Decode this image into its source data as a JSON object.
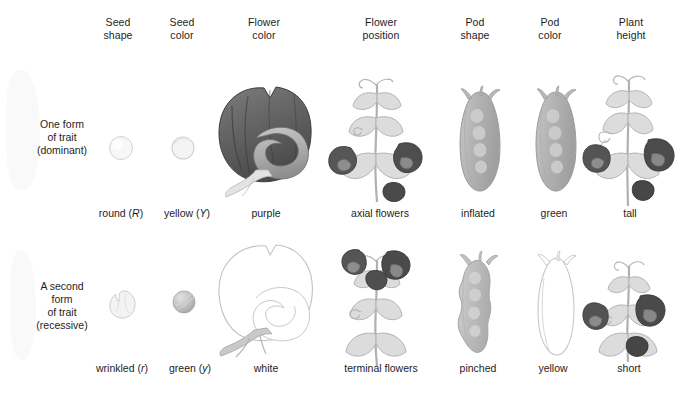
{
  "figure": {
    "background_color": "#ffffff",
    "text_color": "#1d1d1d"
  },
  "columns": [
    {
      "id": "seed-shape",
      "line1": "Seed",
      "line2": "shape"
    },
    {
      "id": "seed-color",
      "line1": "Seed",
      "line2": "color"
    },
    {
      "id": "flower-color",
      "line1": "Flower",
      "line2": "color"
    },
    {
      "id": "flower-position",
      "line1": "Flower",
      "line2": "position"
    },
    {
      "id": "pod-shape",
      "line1": "Pod",
      "line2": "shape"
    },
    {
      "id": "pod-color",
      "line1": "Pod",
      "line2": "color"
    },
    {
      "id": "plant-height",
      "line1": "Plant",
      "line2": "height"
    }
  ],
  "rows": [
    {
      "id": "dominant",
      "label_lines": [
        "One form",
        "of trait",
        "(dominant)"
      ],
      "captions": [
        {
          "id": "seed-shape",
          "text": "round",
          "allele": "R"
        },
        {
          "id": "seed-color",
          "text": "yellow",
          "allele": "Y"
        },
        {
          "id": "flower-color",
          "text": "purple",
          "allele": ""
        },
        {
          "id": "flower-position",
          "text": "axial flowers",
          "allele": ""
        },
        {
          "id": "pod-shape",
          "text": "inflated",
          "allele": ""
        },
        {
          "id": "pod-color",
          "text": "green",
          "allele": ""
        },
        {
          "id": "plant-height",
          "text": "tall",
          "allele": ""
        }
      ]
    },
    {
      "id": "recessive",
      "label_lines": [
        "A second",
        "form",
        "of trait",
        "(recessive)"
      ],
      "captions": [
        {
          "id": "seed-shape",
          "text": "wrinkled",
          "allele": "r"
        },
        {
          "id": "seed-color",
          "text": "green",
          "allele": "y"
        },
        {
          "id": "flower-color",
          "text": "white",
          "allele": ""
        },
        {
          "id": "flower-position",
          "text": "terminal flowers",
          "allele": ""
        },
        {
          "id": "pod-shape",
          "text": "pinched",
          "allele": ""
        },
        {
          "id": "pod-color",
          "text": "yellow",
          "allele": ""
        },
        {
          "id": "plant-height",
          "text": "short",
          "allele": ""
        }
      ]
    }
  ],
  "illustrations": {
    "seed_round": "round-seed-illustration",
    "seed_wrinkled": "wrinkled-seed-illustration",
    "seed_yellow": "yellow-seed-illustration",
    "seed_green": "green-seed-illustration",
    "flower_purple": "purple-flower-illustration",
    "flower_white": "white-flower-illustration",
    "plant_axial": "axial-flower-plant-illustration",
    "plant_terminal": "terminal-flower-plant-illustration",
    "pod_inflated": "inflated-pod-illustration",
    "pod_pinched": "pinched-pod-illustration",
    "pod_green": "green-pod-illustration",
    "pod_yellow": "yellow-pod-illustration",
    "plant_tall": "tall-plant-illustration",
    "plant_short": "short-plant-illustration"
  },
  "palette": {
    "outline_light": "#c9c9c9",
    "leaf_light": "#d8d8d8",
    "leaf_mid": "#c0c0c0",
    "flower_dark": "#5a5a5a",
    "flower_darker": "#3f3f3f",
    "pod_gray": "#b4b4b4",
    "seed_pale": "#f0f0f0",
    "seed_gray": "#b8b8b8"
  }
}
